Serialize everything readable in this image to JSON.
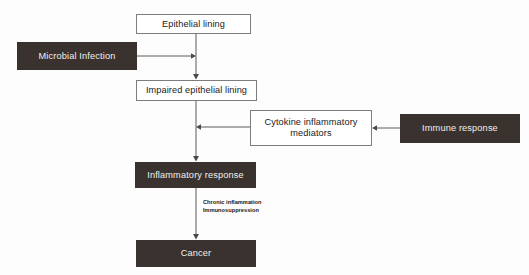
{
  "diagram": {
    "colors": {
      "filled_fill": "#3a322e",
      "filled_text": "#f2f0ee",
      "outline_stroke": "#7d7d7d",
      "outline_fill": "#ffffff",
      "outline_text": "#1a1a1a",
      "connector": "#5a5a5a",
      "background": "#fdfdfd"
    },
    "nodes": [
      {
        "id": "epithelial-lining",
        "label": "Epithelial lining",
        "style": "outline",
        "x": 136,
        "y": 14,
        "w": 115,
        "h": 20
      },
      {
        "id": "microbial-infection",
        "label": "Microbial Infection",
        "style": "filled",
        "x": 17,
        "y": 42,
        "w": 120,
        "h": 28
      },
      {
        "id": "impaired-epithelial-lining",
        "label": "Impaired epithelial lining",
        "style": "outline",
        "x": 136,
        "y": 80,
        "w": 121,
        "h": 21
      },
      {
        "id": "cytokine-inflammatory-mediators",
        "label": "Cytokine inflammatory\nmediators",
        "style": "outline",
        "x": 250,
        "y": 110,
        "w": 122,
        "h": 36
      },
      {
        "id": "immune-response",
        "label": "Immune response",
        "style": "filled",
        "x": 400,
        "y": 114,
        "w": 120,
        "h": 29
      },
      {
        "id": "inflammatory-response",
        "label": "Inflammatory response",
        "style": "filled",
        "x": 135,
        "y": 162,
        "w": 121,
        "h": 26
      },
      {
        "id": "cancer",
        "label": "Cancer",
        "style": "filled",
        "x": 136,
        "y": 240,
        "w": 120,
        "h": 27
      }
    ],
    "edges": [
      {
        "id": "epithelial-to-impaired",
        "from": "epithelial-lining",
        "to": "impaired-epithelial-lining",
        "direction": "down"
      },
      {
        "id": "microbial-to-trunk",
        "from": "microbial-infection",
        "to": "epithelial-to-impaired",
        "direction": "right"
      },
      {
        "id": "impaired-to-inflammatory",
        "from": "impaired-epithelial-lining",
        "to": "inflammatory-response",
        "direction": "down"
      },
      {
        "id": "cytokine-to-trunk",
        "from": "cytokine-inflammatory-mediators",
        "to": "impaired-to-inflammatory",
        "direction": "left"
      },
      {
        "id": "immune-to-cytokine",
        "from": "immune-response",
        "to": "cytokine-inflammatory-mediators",
        "direction": "left"
      },
      {
        "id": "inflammatory-to-cancer",
        "from": "inflammatory-response",
        "to": "cancer",
        "direction": "down",
        "label": "Chronic inflammation\nImmunosuppression"
      }
    ],
    "edge_labels": {
      "inflammatory_to_cancer": "Chronic inflammation\nImmunosuppression"
    }
  }
}
